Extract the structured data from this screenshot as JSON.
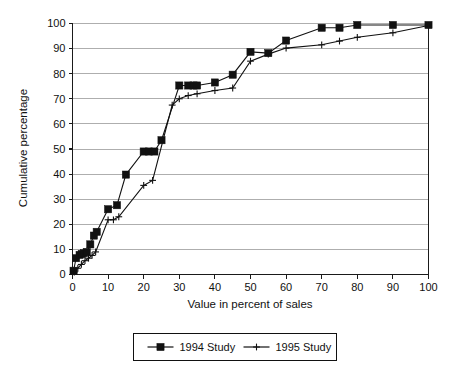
{
  "chart_data": {
    "type": "line",
    "title": "",
    "xlabel": "Value in percent of sales",
    "ylabel": "Cumulative percentage",
    "xlim": [
      0,
      100
    ],
    "ylim": [
      0,
      100
    ],
    "xticks": [
      0,
      10,
      20,
      30,
      40,
      50,
      60,
      70,
      80,
      90,
      100
    ],
    "yticks": [
      0,
      10,
      20,
      30,
      40,
      50,
      60,
      70,
      80,
      90,
      100
    ],
    "grid": "horizontal",
    "legend_position": "below",
    "series": [
      {
        "name": "1994 Study",
        "marker": "filled-square",
        "points": [
          [
            0.3,
            1.5
          ],
          [
            1.0,
            6.5
          ],
          [
            2.0,
            7.8
          ],
          [
            2.6,
            8.2
          ],
          [
            3.2,
            8.5
          ],
          [
            4.0,
            9.0
          ],
          [
            5.0,
            12.0
          ],
          [
            6.0,
            15.5
          ],
          [
            6.8,
            17.0
          ],
          [
            10.0,
            26.0
          ],
          [
            12.5,
            27.6
          ],
          [
            15.0,
            39.8
          ],
          [
            20.0,
            49.0
          ],
          [
            21.5,
            49.0
          ],
          [
            23.0,
            49.0
          ],
          [
            25.0,
            53.5
          ],
          [
            30.0,
            75.3
          ],
          [
            32.5,
            75.3
          ],
          [
            34.0,
            75.3
          ],
          [
            35.0,
            75.3
          ],
          [
            40.0,
            76.5
          ],
          [
            45.0,
            79.6
          ],
          [
            50.0,
            88.7
          ],
          [
            55.0,
            88.2
          ],
          [
            60.0,
            93.2
          ],
          [
            70.0,
            98.3
          ],
          [
            75.0,
            98.3
          ],
          [
            80.0,
            99.4
          ],
          [
            90.0,
            99.4
          ],
          [
            100.0,
            99.4
          ]
        ]
      },
      {
        "name": "1995 Study",
        "marker": "plus",
        "points": [
          [
            0.5,
            1.0
          ],
          [
            1.5,
            2.5
          ],
          [
            2.5,
            4.0
          ],
          [
            3.5,
            5.5
          ],
          [
            4.5,
            6.5
          ],
          [
            5.5,
            7.6
          ],
          [
            6.5,
            9.0
          ],
          [
            10.0,
            21.8
          ],
          [
            11.5,
            21.8
          ],
          [
            13.0,
            23.0
          ],
          [
            20.0,
            35.5
          ],
          [
            22.5,
            37.5
          ],
          [
            28.0,
            67.5
          ],
          [
            30.0,
            70.0
          ],
          [
            32.5,
            71.3
          ],
          [
            35.0,
            72.0
          ],
          [
            40.0,
            73.3
          ],
          [
            45.0,
            74.3
          ],
          [
            50.0,
            85.0
          ],
          [
            55.0,
            87.8
          ],
          [
            60.0,
            90.2
          ],
          [
            70.0,
            91.5
          ],
          [
            75.0,
            93.0
          ],
          [
            80.0,
            94.5
          ],
          [
            90.0,
            96.3
          ],
          [
            100.0,
            99.2
          ]
        ]
      }
    ],
    "legend": [
      {
        "label": "1994 Study",
        "marker": "filled-square"
      },
      {
        "label": "1995 Study",
        "marker": "plus"
      }
    ]
  },
  "colors": {
    "ink": "#111111",
    "grid": "#9a9a9a",
    "background": "#ffffff"
  }
}
